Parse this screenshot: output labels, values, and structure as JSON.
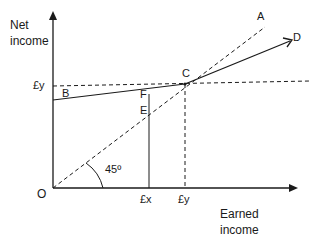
{
  "diagram": {
    "y_axis_label_line1": "Net",
    "y_axis_label_line2": "income",
    "x_axis_label_line1": "Earned",
    "x_axis_label_line2": "income",
    "origin_label": "O",
    "y_tick_label": "£y",
    "x_tick_label_1": "£x",
    "x_tick_label_2": "£y",
    "angle_label": "45º",
    "points": {
      "A": "A",
      "B": "B",
      "C": "C",
      "D": "D",
      "E": "E",
      "F": "F"
    },
    "colors": {
      "line": "#1a1a1a",
      "background": "#ffffff"
    }
  }
}
